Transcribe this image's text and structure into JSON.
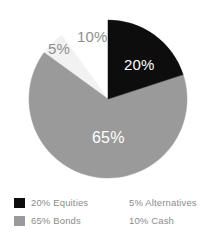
{
  "chart_data": {
    "type": "pie",
    "title": "",
    "subtitle": "",
    "xlabel": "",
    "ylabel": "",
    "grid": false,
    "legend_position": "bottom",
    "start_angle_deg": 0,
    "direction": "clockwise",
    "center": {
      "x": 108,
      "y": 99
    },
    "radius": 79,
    "categories": [
      "Equities",
      "Bonds",
      "Alternatives",
      "Cash"
    ],
    "values": [
      20,
      65,
      5,
      10
    ],
    "value_labels": [
      "20%",
      "65%",
      "5%",
      "10%"
    ],
    "slice_colors": [
      "#0d0d0d",
      "#9a9a9a",
      "#f2f2f2",
      "#ffffff"
    ],
    "label_text_colors": [
      "#ffffff",
      "#ffffff",
      "#8f8f8f",
      "#8f8f8f"
    ],
    "slices": [
      {
        "name": "Equities",
        "value": 20,
        "label": "20%",
        "color": "#0d0d0d",
        "start_deg": 0,
        "end_deg": 72,
        "label_color": "#ffffff",
        "label_placement": "inside"
      },
      {
        "name": "Bonds",
        "value": 65,
        "label": "65%",
        "color": "#9a9a9a",
        "start_deg": 72,
        "end_deg": 306,
        "label_color": "#ffffff",
        "label_placement": "inside"
      },
      {
        "name": "Alternatives",
        "value": 5,
        "label": "5%",
        "color": "#f2f2f2",
        "start_deg": 306,
        "end_deg": 324,
        "label_color": "#8f8f8f",
        "label_placement": "outside"
      },
      {
        "name": "Cash",
        "value": 10,
        "label": "10%",
        "color": "#ffffff",
        "start_deg": 324,
        "end_deg": 360,
        "label_color": "#8f8f8f",
        "label_placement": "outside"
      }
    ],
    "legend": [
      {
        "label": "20% Equities",
        "swatch": "#0d0d0d",
        "swatch_visible": true,
        "column": "left"
      },
      {
        "label": "65% Bonds",
        "swatch": "#9a9a9a",
        "swatch_visible": true,
        "column": "left"
      },
      {
        "label": "5% Alternatives",
        "swatch": "#ffffff",
        "swatch_visible": false,
        "column": "right"
      },
      {
        "label": "10% Cash",
        "swatch": "#ffffff",
        "swatch_visible": false,
        "column": "right"
      }
    ]
  },
  "colors": {
    "background": "#ffffff",
    "equities": "#0d0d0d",
    "bonds": "#9a9a9a",
    "alternatives": "#f2f2f2",
    "cash": "#ffffff",
    "legend_text": "#8c8c8c",
    "outside_label_text": "#8f8f8f",
    "inside_label_text": "#ffffff"
  }
}
